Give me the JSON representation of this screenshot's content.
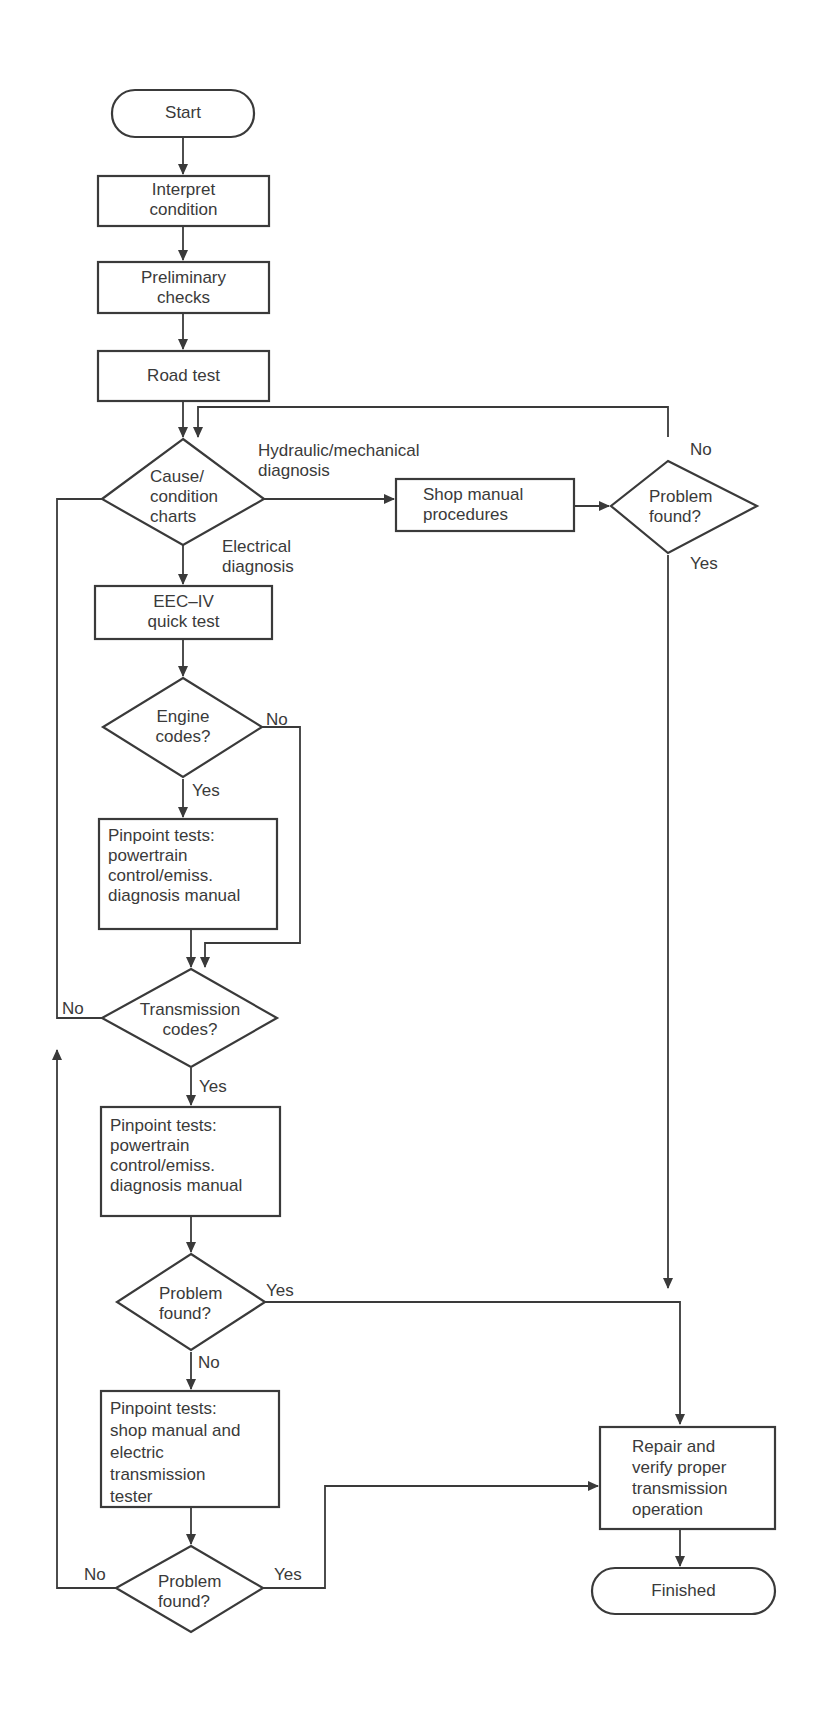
{
  "diagram": {
    "type": "flowchart",
    "colors": {
      "ink": "#3a3a3a",
      "background": "#ffffff"
    },
    "nodes": {
      "start": {
        "shape": "terminator",
        "lines": [
          "Start"
        ]
      },
      "interpret": {
        "shape": "process",
        "lines": [
          "Interpret",
          "condition"
        ]
      },
      "preliminary": {
        "shape": "process",
        "lines": [
          "Preliminary",
          "checks"
        ]
      },
      "road_test": {
        "shape": "process",
        "lines": [
          "Road test"
        ]
      },
      "cause_charts": {
        "shape": "decision",
        "lines": [
          "Cause/",
          "condition",
          "charts"
        ]
      },
      "shop_manual": {
        "shape": "process",
        "lines": [
          "Shop manual",
          "procedures"
        ]
      },
      "problem_found_1": {
        "shape": "decision",
        "lines": [
          "Problem",
          "found?"
        ]
      },
      "eec_iv": {
        "shape": "process",
        "lines": [
          "EEC–IV",
          "quick test"
        ]
      },
      "engine_codes": {
        "shape": "decision",
        "lines": [
          "Engine",
          "codes?"
        ]
      },
      "pinpoint_1": {
        "shape": "process",
        "lines": [
          "Pinpoint tests:",
          "powertrain",
          "control/emiss.",
          "diagnosis manual"
        ]
      },
      "transmission_codes": {
        "shape": "decision",
        "lines": [
          "Transmission",
          "codes?"
        ]
      },
      "pinpoint_2": {
        "shape": "process",
        "lines": [
          "Pinpoint tests:",
          "powertrain",
          "control/emiss.",
          "diagnosis manual"
        ]
      },
      "problem_found_2": {
        "shape": "decision",
        "lines": [
          "Problem",
          "found?"
        ]
      },
      "pinpoint_3": {
        "shape": "process",
        "lines": [
          "Pinpoint tests:",
          "shop manual and",
          "electric",
          "transmission",
          "tester"
        ]
      },
      "problem_found_3": {
        "shape": "decision",
        "lines": [
          "Problem",
          "found?"
        ]
      },
      "repair": {
        "shape": "process",
        "lines": [
          "Repair and",
          "verify proper",
          "transmission",
          "operation"
        ]
      },
      "finished": {
        "shape": "terminator",
        "lines": [
          "Finished"
        ]
      }
    },
    "edge_labels": {
      "hydraulic": [
        "Hydraulic/mechanical",
        "diagnosis"
      ],
      "electrical": [
        "Electrical",
        "diagnosis"
      ],
      "pf1_no": "No",
      "pf1_yes": "Yes",
      "engine_no": "No",
      "engine_yes": "Yes",
      "trans_no": "No",
      "trans_yes": "Yes",
      "pf2_yes": "Yes",
      "pf2_no": "No",
      "pf3_no": "No",
      "pf3_yes": "Yes"
    },
    "edges": [
      [
        "start",
        "interpret"
      ],
      [
        "interpret",
        "preliminary"
      ],
      [
        "preliminary",
        "road_test"
      ],
      [
        "road_test",
        "cause_charts"
      ],
      [
        "cause_charts",
        "shop_manual",
        "Hydraulic/mechanical diagnosis"
      ],
      [
        "shop_manual",
        "problem_found_1"
      ],
      [
        "problem_found_1",
        "cause_charts",
        "No"
      ],
      [
        "problem_found_1",
        "repair",
        "Yes"
      ],
      [
        "cause_charts",
        "eec_iv",
        "Electrical diagnosis"
      ],
      [
        "eec_iv",
        "engine_codes"
      ],
      [
        "engine_codes",
        "pinpoint_1",
        "Yes"
      ],
      [
        "engine_codes",
        "transmission_codes",
        "No"
      ],
      [
        "pinpoint_1",
        "transmission_codes"
      ],
      [
        "transmission_codes",
        "cause_charts",
        "No"
      ],
      [
        "transmission_codes",
        "pinpoint_2",
        "Yes"
      ],
      [
        "pinpoint_2",
        "problem_found_2"
      ],
      [
        "problem_found_2",
        "repair",
        "Yes"
      ],
      [
        "problem_found_2",
        "pinpoint_3",
        "No"
      ],
      [
        "pinpoint_3",
        "problem_found_3"
      ],
      [
        "problem_found_3",
        "repair",
        "Yes"
      ],
      [
        "problem_found_3",
        "transmission_codes",
        "No"
      ],
      [
        "repair",
        "finished"
      ]
    ]
  }
}
